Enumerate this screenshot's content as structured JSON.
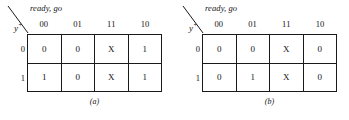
{
  "figure": {
    "maps": [
      {
        "id": "map-a",
        "column_variables": "ready, go",
        "row_variable": "y",
        "row_variable_superscript": "+",
        "column_headers": [
          "00",
          "01",
          "11",
          "10"
        ],
        "row_headers": [
          "0",
          "1"
        ],
        "cells": [
          [
            "0",
            "0",
            "X",
            "1"
          ],
          [
            "1",
            "0",
            "X",
            "1"
          ]
        ],
        "caption": "(a)"
      },
      {
        "id": "map-b",
        "column_variables": "ready, go",
        "row_variable": "y",
        "row_variable_superscript": "+",
        "column_headers": [
          "00",
          "01",
          "11",
          "10"
        ],
        "row_headers": [
          "0",
          "1"
        ],
        "cells": [
          [
            "0",
            "0",
            "X",
            "0"
          ],
          [
            "0",
            "1",
            "X",
            "0"
          ]
        ],
        "caption": "(b)"
      }
    ]
  },
  "colors": {
    "ink": "#141414",
    "rule": "#1a1a1a",
    "background": "#ffffff"
  }
}
